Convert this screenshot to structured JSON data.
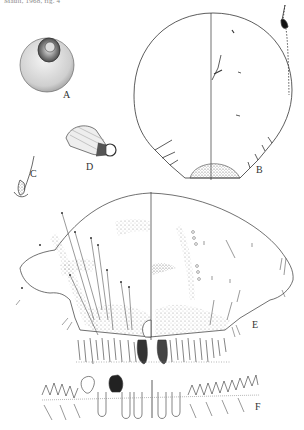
{
  "caption": {
    "text": "Mauli, 1968, fig. 4",
    "visible": "partially cut off at top edge"
  },
  "figure": {
    "panels": [
      {
        "id": "A",
        "label": "A",
        "description": "test / scale cover, dorsal view"
      },
      {
        "id": "B",
        "label": "B",
        "description": "adult female, whole body, dorsal left / ventral right"
      },
      {
        "id": "C",
        "label": "C",
        "description": "seta detail"
      },
      {
        "id": "D",
        "label": "D",
        "description": "gland pore / duct detail"
      },
      {
        "id": "E",
        "label": "E",
        "description": "pygidium, enlarged"
      },
      {
        "id": "F",
        "label": "F",
        "description": "pygidial margin with lobes and plates"
      }
    ]
  },
  "colors": {
    "background": "#ffffff",
    "ink": "#2a2a2a",
    "stipple": "#8a8a8a"
  }
}
